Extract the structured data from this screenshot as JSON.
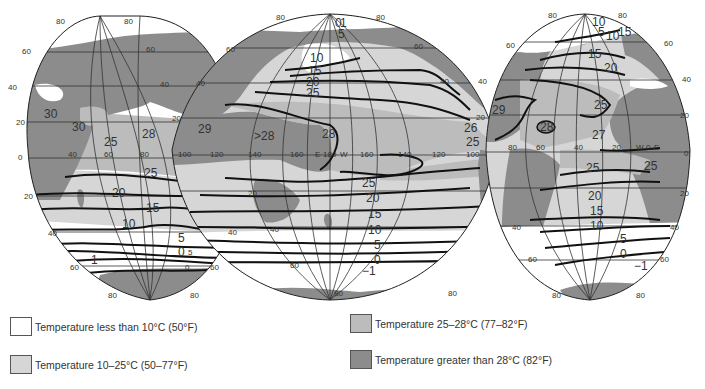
{
  "colors": {
    "cold": "#ffffff",
    "cool": "#d6d6d6",
    "warm": "#bcbcbc",
    "hot": "#8c8c8c",
    "land": "#8c8c8c",
    "line": "#1a1a1a",
    "grid": "#333333"
  },
  "map": {
    "projection": "interrupted-ocean-centered",
    "lobes": [
      {
        "name": "Indian Ocean",
        "lat_labels_left": [
          "80",
          "60",
          "40",
          "20",
          "0",
          "20",
          "40",
          "60",
          "80"
        ],
        "lat_labels_right": [
          "80",
          "60",
          "40",
          "20",
          "40",
          "60",
          "80"
        ],
        "lon_labels": [
          "40",
          "60",
          "80"
        ],
        "isotherm_labels": [
          "30",
          "30",
          "28",
          "25",
          "25",
          "20",
          "15",
          "10",
          "5",
          "0",
          "-1"
        ]
      },
      {
        "name": "Pacific Ocean",
        "lat_labels_left": [
          "80",
          "60",
          "40",
          "20",
          "20",
          "40",
          "60",
          "80"
        ],
        "lat_labels_right": [
          "80",
          "60",
          "40",
          "80"
        ],
        "lon_labels": [
          "100",
          "120",
          "140",
          "160",
          "E",
          "180",
          "W",
          "160",
          "140",
          "120",
          "100"
        ],
        "isotherm_labels": [
          "0",
          "1",
          "5",
          "10",
          "15",
          "20",
          "25",
          "29",
          ">28",
          "28",
          "26",
          "25",
          "25",
          "20",
          "15",
          "10",
          "5",
          "0",
          "-1"
        ]
      },
      {
        "name": "Atlantic Ocean",
        "lat_labels_left": [
          "80",
          "60",
          "40",
          "20",
          "40",
          "60",
          "80"
        ],
        "lat_labels_right": [
          "80",
          "60",
          "40",
          "20",
          "0",
          "20",
          "40",
          "60",
          "80"
        ],
        "lon_labels": [
          "80",
          "60",
          "40",
          "20",
          "W",
          "0",
          "E"
        ],
        "isotherm_labels": [
          "10",
          "5",
          "10",
          "15",
          "15",
          "20",
          "25",
          "29",
          "28",
          "27",
          "25",
          "25",
          "20",
          "15",
          "10",
          "5",
          "0",
          "-1"
        ]
      }
    ]
  },
  "legend": {
    "items": [
      {
        "key": "cold",
        "label": "Temperature less than 10°C (50°F)"
      },
      {
        "key": "cool",
        "label": "Temperature 10–25°C (50–77°F)"
      },
      {
        "key": "warm",
        "label": "Temperature 25–28°C (77–82°F)"
      },
      {
        "key": "hot",
        "label": "Temperature greater than 28°C (82°F)"
      }
    ]
  }
}
